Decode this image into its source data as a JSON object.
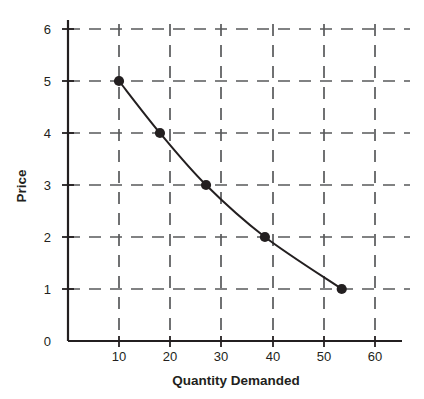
{
  "chart_data": {
    "type": "line",
    "title": "",
    "subtitle": "",
    "xlabel": "Quantity Demanded",
    "ylabel": "Price",
    "xlim": [
      0,
      65
    ],
    "ylim": [
      0,
      6.3
    ],
    "xticks": [
      10,
      20,
      30,
      40,
      50,
      60
    ],
    "xtick_labels": [
      "10",
      "20",
      "30",
      "40",
      "50",
      "60"
    ],
    "yticks": [
      0,
      1,
      2,
      3,
      4,
      5,
      6
    ],
    "ytick_labels": [
      "0",
      "1",
      "2",
      "3",
      "4",
      "5",
      "6"
    ],
    "grid": true,
    "grid_style": "dashed",
    "grid_color": "#58595b",
    "legend": false,
    "legend_position": "none",
    "series": [
      {
        "name": "Demand",
        "marker": "filled-circle",
        "color": "#231f20",
        "x": [
          10,
          18,
          27,
          38.5,
          53.5
        ],
        "y": [
          5,
          4,
          3,
          2,
          1
        ],
        "points": [
          {
            "quantity_demanded": 10,
            "price": 5
          },
          {
            "quantity_demanded": 18,
            "price": 4
          },
          {
            "quantity_demanded": 27,
            "price": 3
          },
          {
            "quantity_demanded": 38.5,
            "price": 2
          },
          {
            "quantity_demanded": 53.5,
            "price": 1
          }
        ]
      }
    ],
    "annotations": []
  },
  "axes": {
    "y_axis_label": "Price",
    "x_axis_label": "Quantity Demanded",
    "y_tick_labels": [
      "6",
      "5",
      "4",
      "3",
      "2",
      "1",
      "0"
    ],
    "x_tick_labels": [
      "10",
      "20",
      "30",
      "40",
      "50",
      "60"
    ]
  },
  "colors": {
    "line": "#231f20",
    "marker": "#231f20",
    "grid": "#58595b",
    "axis": "#231f20",
    "background": "#ffffff",
    "text": "#231f20"
  }
}
